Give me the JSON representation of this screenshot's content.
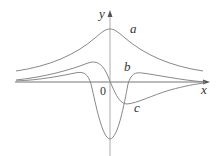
{
  "axes": {
    "x_label": "x",
    "y_label": "y",
    "origin_label": "0"
  },
  "curves": [
    {
      "name": "a",
      "label": "a"
    },
    {
      "name": "b",
      "label": "b"
    },
    {
      "name": "c",
      "label": "c"
    }
  ]
}
